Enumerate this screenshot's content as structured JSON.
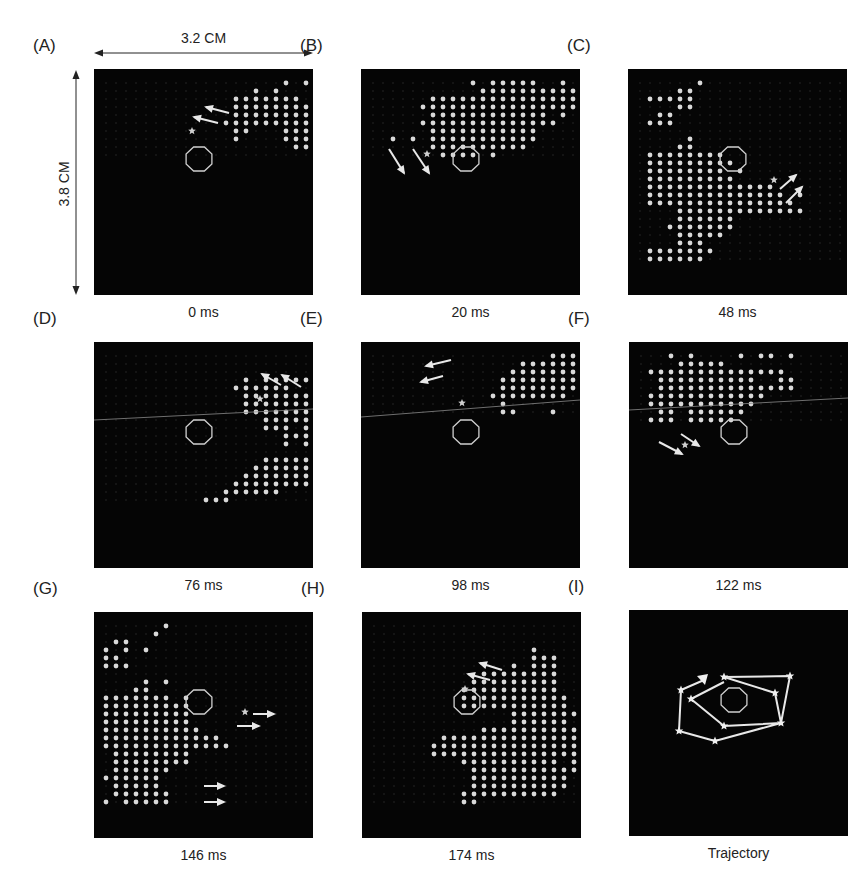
{
  "dimensions": {
    "width_label": "3.2 CM",
    "height_label": "3.8 CM"
  },
  "grid": {
    "col_start": 12,
    "col_pitch": 10,
    "row_start": 14,
    "row_pitch": 8
  },
  "octagon": {
    "cx": 105,
    "cy": 90,
    "rx": 14,
    "ry": 13
  },
  "colors": {
    "background": "#050505",
    "dot": "#d9d9d9",
    "dot_dim": "#6a6a6a",
    "line": "#e8e8e8",
    "octagon": "#cfcfcf"
  },
  "panels": [
    {
      "id": "A",
      "label": "(A)",
      "caption": "0 ms",
      "x": 94,
      "y": 69,
      "dots": [
        "..................1.1",
        "...............1.1...",
        ".............1111111.",
        ".............11111111",
        ".............11111111",
        "............111111111",
        ".............11...111",
        ".............1....111",
        "...................11",
        "....................."
      ],
      "star": [
        98,
        62
      ],
      "arrows": [
        [
          135,
          44,
          112,
          38
        ],
        [
          124,
          54,
          100,
          48
        ]
      ],
      "hline": null
    },
    {
      "id": "B",
      "label": "(B)",
      "caption": "20 ms",
      "x": 361,
      "y": 69,
      "dots": [
        "..........1.11111..1.",
        "...........1111111111.",
        "......11111111111111111",
        ".....1111111111111111..",
        "......111111111111.1...",
        ".....11111111111111....",
        "......11111111111......",
        "..1.1.11111111111......",
        "......1111111111.......",
        ".......1111.1.........."
      ],
      "star": [
        66,
        85
      ],
      "arrows": [
        [
          28,
          80,
          43,
          104
        ],
        [
          52,
          80,
          68,
          104
        ]
      ],
      "hline": null
    },
    {
      "id": "C",
      "label": "(C)",
      "caption": "48 ms",
      "x": 628,
      "y": 69,
      "dots": [
        "......1..............",
        "....11...............",
        ".11111...............",
        "....11...............",
        "..11.................",
        ".111.................",
        ".....................",
        ".....1...............",
        "....11...............",
        ".11111111............",
        ".111111111...........",
        ".11111111.1..........",
        ".111111111...........",
        ".1111111111111.......",
        ".11111111111111.1.....",
        ".111111111111111......",
        "....1111111111111.....",
        "....111111............",
        "...1111111............",
        "....11111.............",
        "....111...............",
        ".1111111..............",
        ".111111..............."
      ],
      "star": [
        146,
        111
      ],
      "arrows": [
        [
          152,
          120,
          168,
          106
        ],
        [
          158,
          134,
          174,
          118
        ]
      ],
      "hline": null
    },
    {
      "id": "D",
      "label": "(D)",
      "caption": "76 ms",
      "x": 94,
      "y": 342,
      "dots": [
        ".....................",
        ".....................",
        ".....................",
        "..............1.11111",
        ".............111111..",
        "..............1111111",
        "..............11111111",
        "..............1111111",
        "................11111",
        "................111.1",
        "..................111",
        "..................1.1",
        ".....................",
        "................11111",
        "...............111111",
        "..............1111111",
        ".............11111111",
        "............111111...",
        "..........111........"
      ],
      "star": [
        166,
        57
      ],
      "arrows": [
        [
          187,
          43,
          168,
          32
        ],
        [
          207,
          45,
          188,
          33
        ]
      ],
      "hline": [
        0,
        78,
        219,
        67
      ]
    },
    {
      "id": "E",
      "label": "(E)",
      "caption": "98 ms",
      "x": 361,
      "y": 342,
      "dots": [
        "..................111.",
        "...............111111",
        "..............1111111",
        ".............11111111",
        ".............11111111",
        "............11111111.",
        ".............1.......",
        ".............11...1..."
      ],
      "star": [
        101,
        61
      ],
      "arrows": [
        [
          90,
          18,
          65,
          24
        ],
        [
          82,
          34,
          60,
          40
        ]
      ],
      "hline": [
        0,
        75,
        219,
        58
      ]
    },
    {
      "id": "F",
      "label": "(F)",
      "caption": "122 ms",
      "x": 629,
      "y": 342,
      "dots": [
        "...1.1....1.11.1.....",
        "....11111............",
        ".11111111111111.......",
        "..1111111111..11......",
        "..11111111111111......",
        ".111111111111.........",
        ".11111111111..........",
        "..11.111111...........",
        ".111.11111............"
      ],
      "star": [
        56,
        103
      ],
      "arrows": [
        [
          30,
          100,
          53,
          112
        ],
        [
          52,
          92,
          70,
          104
        ]
      ],
      "hline": [
        0,
        68,
        219,
        56
      ]
    },
    {
      "id": "G",
      "label": "(G)",
      "caption": "146 ms",
      "x": 94,
      "y": 612,
      "dots": [
        "......1..............",
        ".....1...............",
        ".11..................",
        "1.1.1................",
        "11...................",
        "111..................",
        ".....................",
        "....1.1..............",
        "...11................",
        "1111111.1............",
        "111111111............",
        "111111111............",
        "111111111............",
        "1111111111...........",
        "111111111111.........",
        "1111111111111........",
        ".11111111............",
        ".11111111............",
        ".111111..............",
        "111111...............",
        ".11111...............",
        ".111111..............",
        "1.11111.............."
      ],
      "star": [
        151,
        100
      ],
      "arrows": [
        [
          143,
          114,
          165,
          114
        ],
        [
          159,
          102,
          180,
          102
        ],
        [
          110,
          174,
          130,
          174
        ],
        [
          110,
          190,
          130,
          190
        ]
      ],
      "hline": null
    },
    {
      "id": "H",
      "label": "(H)",
      "caption": "174 ms",
      "x": 362,
      "y": 612,
      "dots": [
        ".....................",
        ".....................",
        ".....................",
        "................1....",
        "................111..",
        "..............1.111..",
        "...........11111111..",
        "..........111111111..",
        ".........1111111111..",
        ".........11111111111.",
        ".........11111111111.",
        "..............1111111",
        "..............111111.",
        "...........1111111111",
        ".......11111111111111",
        "......111111111111111",
        "......111111111111111",
        ".........1111111111.1",
        "..........11111111111",
        "..........1111111111.",
        "..........1111111111.",
        ".........1111111111..",
        ".........11.........."
      ],
      "star": [
        103,
        77
      ],
      "arrows": [
        [
          140,
          58,
          118,
          51
        ],
        [
          128,
          68,
          106,
          62
        ]
      ],
      "hline": null
    },
    {
      "id": "I",
      "label": "(I)",
      "caption": "Trajectory",
      "x": 629,
      "y": 610,
      "dots": [],
      "star": null,
      "arrows": [],
      "hline": null,
      "trajectory": {
        "path": [
          [
            75,
            70
          ],
          [
            52,
            80
          ],
          [
            50,
            121
          ],
          [
            86,
            131
          ],
          [
            152,
            113
          ],
          [
            146,
            83
          ],
          [
            95,
            67
          ],
          [
            161,
            66
          ],
          [
            152,
            113
          ],
          [
            95,
            116
          ],
          [
            62,
            89
          ],
          [
            95,
            72
          ]
        ],
        "stars": [
          [
            95,
            67
          ],
          [
            161,
            66
          ],
          [
            146,
            83
          ],
          [
            152,
            113
          ],
          [
            95,
            116
          ],
          [
            62,
            89
          ],
          [
            52,
            80
          ],
          [
            50,
            121
          ],
          [
            86,
            131
          ]
        ],
        "arrowhead": [
          75,
          70
        ]
      }
    }
  ]
}
